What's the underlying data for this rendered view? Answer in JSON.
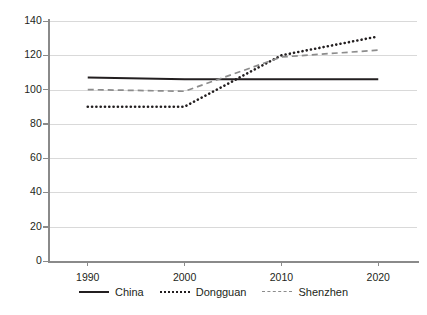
{
  "chart_data": {
    "type": "line",
    "title": "",
    "xlabel": "",
    "ylabel": "",
    "x": [
      1990,
      2000,
      2010,
      2020
    ],
    "xticklabels": [
      "1990",
      "2000",
      "2010",
      "2020"
    ],
    "yticklabels": [
      "0",
      "20",
      "40",
      "60",
      "80",
      "100",
      "120",
      "140"
    ],
    "yticks": [
      0,
      20,
      40,
      60,
      80,
      100,
      120,
      140
    ],
    "ylim": [
      0,
      140
    ],
    "xlim": [
      1986,
      2024
    ],
    "grid": "horizontal",
    "legend_position": "bottom-center",
    "series": [
      {
        "name": "China",
        "style": "solid",
        "color": "#231f20",
        "values": [
          107,
          106,
          106,
          106
        ]
      },
      {
        "name": "Dongguan",
        "style": "dotted",
        "color": "#231f20",
        "values": [
          90,
          90,
          120,
          131
        ]
      },
      {
        "name": "Shenzhen",
        "style": "dashed",
        "color": "#8c8c8c",
        "values": [
          100,
          99,
          119,
          123
        ]
      }
    ]
  },
  "legend": {
    "items": [
      {
        "label": "China"
      },
      {
        "label": "Dongguan"
      },
      {
        "label": "Shenzhen"
      }
    ]
  }
}
